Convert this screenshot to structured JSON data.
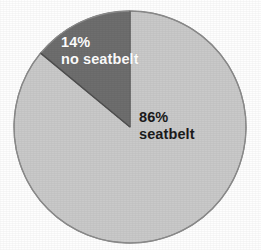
{
  "chart_data": {
    "type": "pie",
    "title": "",
    "subtitle": "",
    "xlabel": "",
    "ylabel": "",
    "legend_position": "none",
    "grid": false,
    "labels_inside_slices": true,
    "start_angle_deg": 0,
    "direction": "counterclockwise",
    "categories": [
      "no seatbelt",
      "seatbelt"
    ],
    "values": [
      14,
      86
    ],
    "units": "percent",
    "slices": [
      {
        "name": "no-seatbelt",
        "percent": 14,
        "percent_text": "14%",
        "category_text": "no seatbelt",
        "color": "#6e6e6e",
        "label_color": "#ffffff",
        "angle_deg": 50.4
      },
      {
        "name": "seatbelt",
        "percent": 86,
        "percent_text": "86%",
        "category_text": "seatbelt",
        "color": "#c9c9c9",
        "label_color": "#1b1b1b",
        "angle_deg": 309.6
      }
    ]
  },
  "figure": {
    "background_color": "#fefefe",
    "outline_color": "#8d8d8d",
    "divider_color": "#555555",
    "center_x": 130,
    "center_y": 127,
    "radius": 116
  },
  "labels": {
    "no_seatbelt": {
      "percent": "14%",
      "category": "no seatbelt"
    },
    "seatbelt": {
      "percent": "86%",
      "category": "seatbelt"
    }
  }
}
